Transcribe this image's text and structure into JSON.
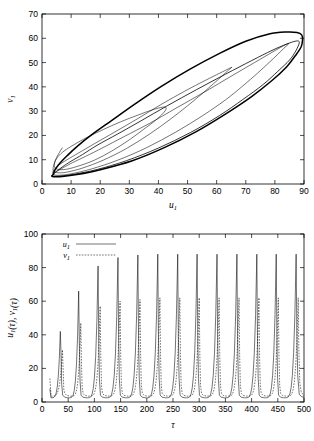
{
  "figure": {
    "title_fragment": "",
    "background": "#ffffff",
    "line_color": "#000000"
  },
  "chart_data": [
    {
      "id": "phase-portrait",
      "type": "line",
      "title": "",
      "xlabel": "u1",
      "ylabel": "v1",
      "xlim": [
        0,
        90
      ],
      "ylim": [
        0,
        70
      ],
      "xticks": [
        0,
        10,
        20,
        30,
        40,
        50,
        60,
        70,
        80,
        90
      ],
      "yticks": [
        0,
        10,
        20,
        30,
        40,
        50,
        60,
        70
      ],
      "grid": false,
      "legend": "none",
      "description": "Phase plane trajectory spiralling outward from an interior initial point toward a stable limit cycle",
      "series": [
        {
          "name": "orbit-1-innermost",
          "style": "solid-thin",
          "points": [
            [
              7,
              15
            ],
            [
              5.6,
              12.2
            ],
            [
              4.6,
              9.8
            ],
            [
              4.2,
              8.0
            ],
            [
              4.4,
              6.8
            ],
            [
              5.6,
              6.0
            ],
            [
              8,
              6.0
            ],
            [
              12,
              7.2
            ],
            [
              18,
              9.8
            ],
            [
              24,
              13.6
            ],
            [
              30,
              18.2
            ],
            [
              35,
              22.6
            ],
            [
              39,
              26.2
            ],
            [
              41.5,
              29.0
            ],
            [
              42.6,
              30.8
            ],
            [
              42.4,
              31.6
            ],
            [
              40.8,
              31.5
            ],
            [
              37.6,
              30.4
            ],
            [
              33,
              28.4
            ],
            [
              27,
              25.6
            ],
            [
              21,
              22.4
            ],
            [
              15.5,
              19.2
            ],
            [
              11,
              16.2
            ],
            [
              7.6,
              13.6
            ],
            [
              5.6,
              11.4
            ],
            [
              4.6,
              9.6
            ]
          ]
        },
        {
          "name": "orbit-2",
          "style": "solid-thin",
          "points": [
            [
              4.6,
              9.6
            ],
            [
              4.0,
              7.6
            ],
            [
              3.8,
              6.0
            ],
            [
              4.2,
              5.0
            ],
            [
              6,
              4.6
            ],
            [
              9,
              5.0
            ],
            [
              14,
              6.6
            ],
            [
              21,
              9.8
            ],
            [
              29,
              14.6
            ],
            [
              37,
              20.6
            ],
            [
              44,
              26.6
            ],
            [
              50,
              32.2
            ],
            [
              55,
              37.2
            ],
            [
              59,
              41.4
            ],
            [
              62,
              44.6
            ],
            [
              64,
              46.8
            ],
            [
              65,
              47.9
            ],
            [
              65.2,
              48.0
            ],
            [
              64,
              47.4
            ],
            [
              61,
              45.6
            ],
            [
              56,
              42.6
            ],
            [
              49,
              38.2
            ],
            [
              41,
              32.8
            ],
            [
              33,
              27.0
            ],
            [
              25,
              21.4
            ],
            [
              18,
              16.6
            ],
            [
              12.6,
              12.8
            ],
            [
              8.6,
              10.0
            ],
            [
              6,
              8.0
            ],
            [
              4.6,
              6.6
            ]
          ]
        },
        {
          "name": "orbit-3",
          "style": "solid-thin",
          "points": [
            [
              4.6,
              6.6
            ],
            [
              3.9,
              5.4
            ],
            [
              3.6,
              4.4
            ],
            [
              4.0,
              3.8
            ],
            [
              6,
              3.6
            ],
            [
              10,
              4.2
            ],
            [
              17,
              6.2
            ],
            [
              26,
              9.8
            ],
            [
              36,
              15.0
            ],
            [
              46,
              21.4
            ],
            [
              55,
              28.0
            ],
            [
              63,
              34.6
            ],
            [
              69,
              40.4
            ],
            [
              74,
              45.6
            ],
            [
              78,
              50.0
            ],
            [
              81,
              53.4
            ],
            [
              83,
              55.8
            ],
            [
              84.3,
              57.2
            ],
            [
              84.8,
              57.8
            ],
            [
              84.3,
              57.7
            ],
            [
              82.6,
              56.7
            ],
            [
              79,
              54.2
            ],
            [
              73,
              50.0
            ],
            [
              65,
              44.4
            ],
            [
              56,
              38.0
            ],
            [
              46,
              31.2
            ],
            [
              37,
              25.0
            ],
            [
              28,
              19.4
            ],
            [
              21,
              15.0
            ],
            [
              15,
              11.4
            ],
            [
              10.5,
              8.8
            ],
            [
              7.4,
              6.8
            ],
            [
              5.4,
              5.4
            ],
            [
              4.2,
              4.4
            ]
          ]
        },
        {
          "name": "orbit-4",
          "style": "solid-med",
          "points": [
            [
              4.2,
              4.4
            ],
            [
              3.6,
              3.8
            ],
            [
              3.5,
              3.4
            ],
            [
              4.0,
              3.2
            ],
            [
              6.5,
              3.3
            ],
            [
              11,
              4.0
            ],
            [
              19,
              6.0
            ],
            [
              29,
              9.6
            ],
            [
              40,
              14.8
            ],
            [
              51,
              21.2
            ],
            [
              61,
              28.2
            ],
            [
              69,
              34.8
            ],
            [
              76,
              41.0
            ],
            [
              81,
              46.4
            ],
            [
              85,
              51.0
            ],
            [
              87,
              54.4
            ],
            [
              88,
              56.8
            ],
            [
              88.4,
              58.2
            ],
            [
              88.2,
              58.8
            ],
            [
              87,
              58.8
            ],
            [
              84,
              57.6
            ],
            [
              79,
              55.0
            ],
            [
              72,
              50.8
            ],
            [
              63,
              45.2
            ],
            [
              53,
              38.8
            ],
            [
              43,
              32.2
            ],
            [
              34,
              26.0
            ],
            [
              26,
              20.6
            ],
            [
              19,
              16.0
            ],
            [
              14,
              12.2
            ],
            [
              10,
              9.4
            ],
            [
              7.2,
              7.2
            ],
            [
              5.4,
              5.6
            ],
            [
              4.3,
              4.6
            ]
          ]
        },
        {
          "name": "limit-cycle",
          "style": "solid-thick",
          "points": [
            [
              4.0,
              4.0
            ],
            [
              3.5,
              3.5
            ],
            [
              3.4,
              3.2
            ],
            [
              4.0,
              3.0
            ],
            [
              7,
              3.1
            ],
            [
              12,
              3.9
            ],
            [
              20,
              5.9
            ],
            [
              31,
              9.6
            ],
            [
              42,
              15.0
            ],
            [
              53,
              21.6
            ],
            [
              63,
              28.8
            ],
            [
              72,
              36.0
            ],
            [
              79,
              42.6
            ],
            [
              84,
              48.2
            ],
            [
              87,
              52.8
            ],
            [
              89,
              56.4
            ],
            [
              89.5,
              59.4
            ],
            [
              89.2,
              61.4
            ],
            [
              87.6,
              62.4
            ],
            [
              84,
              62.6
            ],
            [
              78,
              61.8
            ],
            [
              70,
              58.8
            ],
            [
              61,
              53.8
            ],
            [
              51,
              47.4
            ],
            [
              41,
              40.2
            ],
            [
              32,
              33.0
            ],
            [
              24,
              26.2
            ],
            [
              17,
              20.2
            ],
            [
              12,
              15.4
            ],
            [
              8.6,
              11.6
            ],
            [
              6.2,
              8.6
            ],
            [
              4.8,
              6.4
            ],
            [
              4.1,
              4.8
            ],
            [
              4.0,
              4.0
            ]
          ]
        }
      ]
    },
    {
      "id": "time-series",
      "type": "line",
      "title": "",
      "xlabel": "tau",
      "ylabel": "u1(tau), v1(tau)",
      "xlim": [
        0,
        500
      ],
      "ylim": [
        0,
        100
      ],
      "xticks": [
        0,
        50,
        100,
        150,
        200,
        250,
        300,
        350,
        400,
        450,
        500
      ],
      "yticks": [
        0,
        20,
        40,
        60,
        80,
        100
      ],
      "grid": false,
      "legend_position": "upper-left",
      "legend_entries": [
        {
          "label": "u1",
          "style": "solid"
        },
        {
          "label": "v1",
          "style": "dashed"
        }
      ],
      "description": "Relaxation oscillations of u1 (solid) and v1 (dashed) versus tau; amplitude grows over the first few cycles then saturates at a constant limit-cycle amplitude",
      "period": 37.5,
      "series": [
        {
          "name": "u1",
          "style": "solid",
          "peak_tau": [
            35,
            70,
            107,
            145,
            183,
            221,
            259,
            296,
            334,
            372,
            410,
            447,
            485
          ],
          "peak_values": [
            42,
            66,
            81,
            86,
            87.5,
            88,
            88,
            88,
            88,
            88,
            88,
            88,
            88
          ],
          "trough_value": 2.5,
          "start_tau": 15,
          "start_value": 8
        },
        {
          "name": "v1",
          "style": "dashed",
          "peak_tau": [
            39,
            74,
            111,
            149,
            187,
            225,
            263,
            300,
            338,
            376,
            414,
            451,
            489
          ],
          "peak_values": [
            31,
            47,
            57,
            60,
            61,
            62,
            62,
            62,
            62,
            62,
            62,
            62,
            62
          ],
          "trough_value": 3.5,
          "start_tau": 15,
          "start_value": 14
        }
      ]
    }
  ]
}
